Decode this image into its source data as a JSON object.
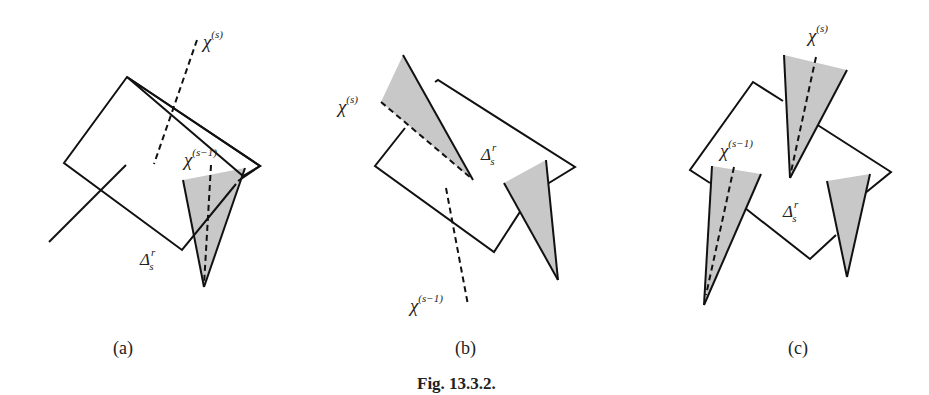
{
  "figure": {
    "caption": "Fig. 13.3.2.",
    "panels": [
      {
        "id": "a",
        "label": "(a)",
        "chi_s": {
          "base": "χ",
          "sup": "(s)"
        },
        "chi_s1": {
          "base": "χ",
          "sup": "(s−1)"
        },
        "delta": {
          "base": "Δ",
          "sup": "r",
          "sub": "s"
        }
      },
      {
        "id": "b",
        "label": "(b)",
        "chi_s": {
          "base": "χ",
          "sup": "(s)"
        },
        "chi_s1": {
          "base": "χ",
          "sup": "(s−1)"
        },
        "delta": {
          "base": "Δ",
          "sup": "r",
          "sub": "s"
        }
      },
      {
        "id": "c",
        "label": "(c)",
        "chi_s": {
          "base": "χ",
          "sup": "(s)"
        },
        "chi_s1": {
          "base": "χ",
          "sup": "(s−1)"
        },
        "delta": {
          "base": "Δ",
          "sup": "r",
          "sub": "s"
        }
      }
    ]
  },
  "colors": {
    "stroke": "#111111",
    "cone_fill": "#c8c8c8",
    "background": "#ffffff"
  }
}
